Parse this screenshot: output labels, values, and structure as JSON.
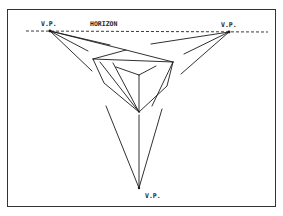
{
  "figure": {
    "labels": {
      "horizon": "HORIZON",
      "vp_left": "V.P.",
      "vp_right": "V.P.",
      "vp_bottom": "V.P."
    },
    "colors": {
      "ink": "#1a1a1a",
      "background": "#ffffff"
    },
    "vanishing_points": [
      {
        "id": "left",
        "x": 50,
        "y": 31
      },
      {
        "id": "right",
        "x": 229,
        "y": 32
      },
      {
        "id": "bottom",
        "x": 139,
        "y": 188
      }
    ],
    "horizon_y": 31,
    "object": "box viewed from above"
  }
}
